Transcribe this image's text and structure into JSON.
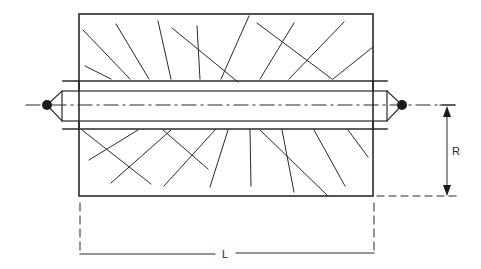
{
  "diagram": {
    "type": "technical-drawing",
    "colors": {
      "line": "#2a2a2a",
      "background": "#ffffff"
    },
    "dimensions": {
      "length_label": "L",
      "radius_label": "R"
    },
    "parts": [
      {
        "name": "roll-body",
        "description": "rectangular section with random hatch lines"
      },
      {
        "name": "shaft",
        "description": "central shaft running through body with conical ends"
      },
      {
        "name": "center-points",
        "description": "filled circles at each shaft end"
      },
      {
        "name": "centerline",
        "description": "dash-dot axis line"
      }
    ]
  }
}
